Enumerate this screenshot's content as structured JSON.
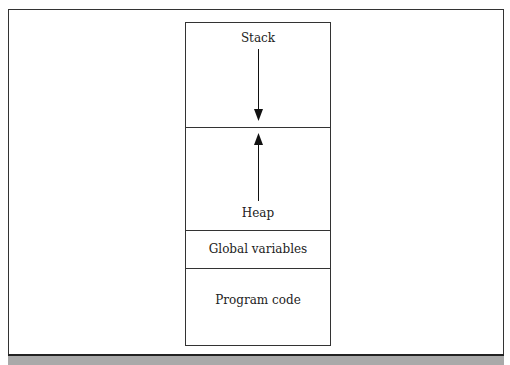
{
  "diagram": {
    "segments": [
      {
        "label": "Stack",
        "direction": "down"
      },
      {
        "label": "Heap",
        "direction": "up"
      },
      {
        "label": "Global variables"
      },
      {
        "label": "Program code"
      }
    ]
  }
}
